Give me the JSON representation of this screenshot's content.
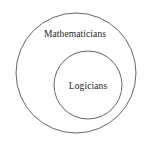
{
  "diagram": {
    "type": "euler-diagram",
    "background_color": "#ffffff",
    "stroke_color": "#666666",
    "text_color": "#1d1d1d",
    "canvas": {
      "width": 153,
      "height": 149
    },
    "sets": [
      {
        "id": "outer",
        "label": "Mathematicians",
        "role": "superset",
        "shape": "circle",
        "center_x": 76,
        "center_y": 73,
        "radius": 60,
        "label_x": 75,
        "label_y": 34
      },
      {
        "id": "inner",
        "label": "Logicians",
        "role": "subset",
        "shape": "circle",
        "center_x": 88,
        "center_y": 85,
        "radius": 34,
        "label_x": 88,
        "label_y": 86
      }
    ]
  }
}
